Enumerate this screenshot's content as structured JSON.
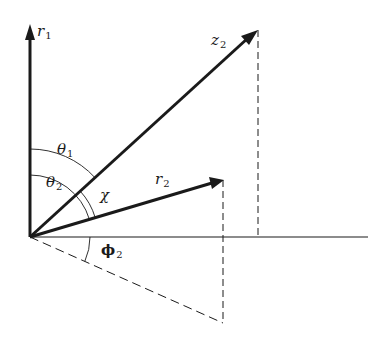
{
  "diagram": {
    "type": "vector-angle-geometry",
    "colors": {
      "line": "#1a1a1a",
      "background": "#ffffff"
    },
    "labels": {
      "r1": {
        "base": "r",
        "sub": "1"
      },
      "z2": {
        "base": "z",
        "sub": "2"
      },
      "r2": {
        "base": "r",
        "sub": "2"
      },
      "theta1": {
        "base": "θ",
        "sub": "1"
      },
      "theta2": {
        "base": "θ",
        "sub": "2"
      },
      "chi": {
        "base": "χ",
        "sub": ""
      },
      "phi2": {
        "base": "ϕ",
        "sub": "2"
      }
    },
    "points": {
      "origin": [
        30,
        237
      ],
      "r1_tip": [
        30,
        25
      ],
      "z2_tip": [
        258,
        30
      ],
      "r2_tip": [
        223,
        180
      ],
      "horizontal_end": [
        368,
        237
      ],
      "z2_foot": [
        258,
        237
      ],
      "r2_projection": [
        223,
        323
      ]
    }
  }
}
